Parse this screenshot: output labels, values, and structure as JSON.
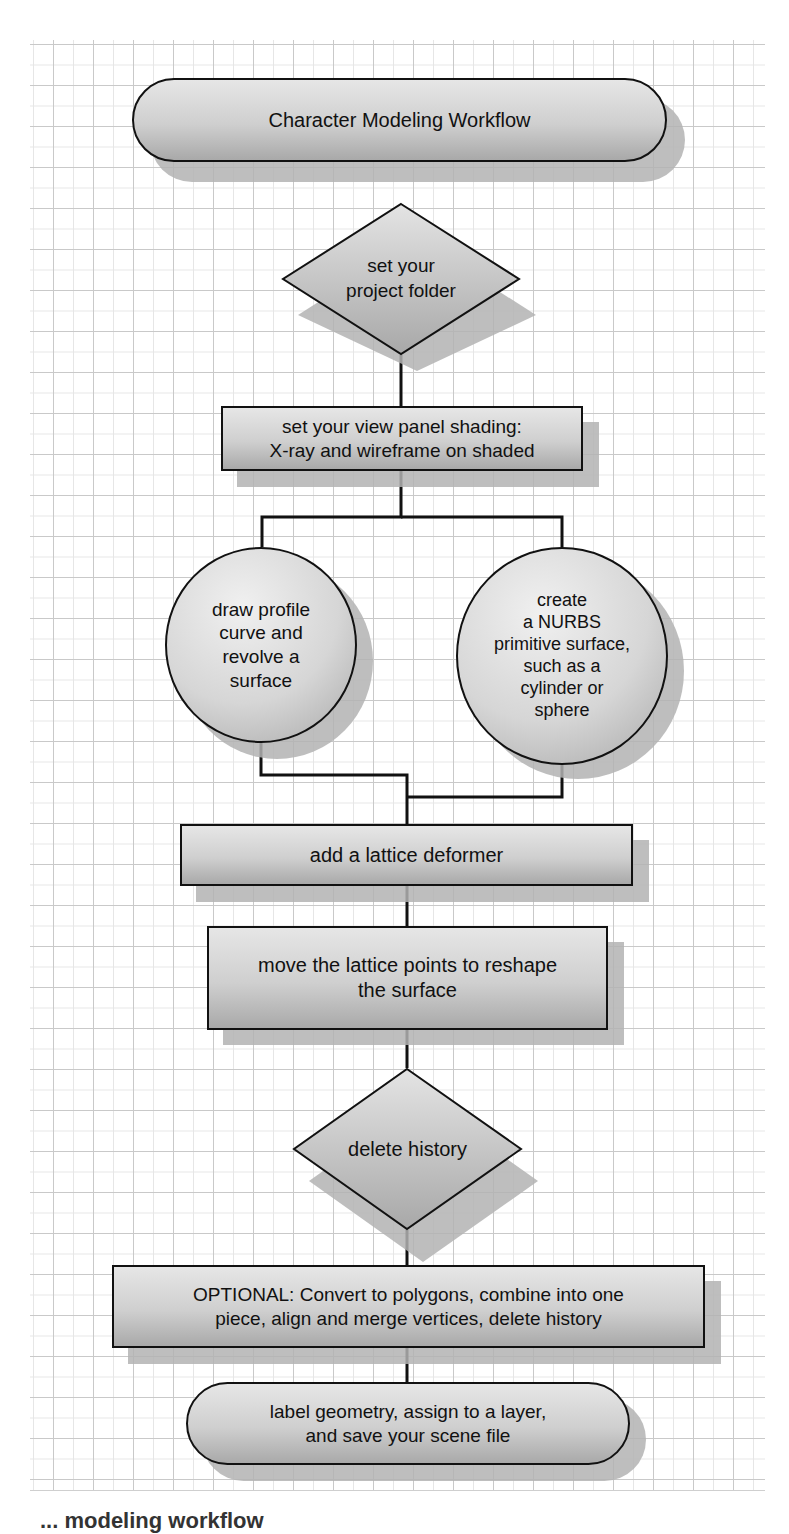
{
  "diagram": {
    "title": "Character Modeling Workflow",
    "nodes": [
      {
        "id": "start",
        "type": "terminator",
        "lines": [
          "Character Modeling Workflow"
        ]
      },
      {
        "id": "project-folder",
        "type": "decision",
        "lines": [
          "set your",
          "project folder"
        ]
      },
      {
        "id": "view-panel",
        "type": "process",
        "lines": [
          "set your view panel shading:",
          "X-ray and wireframe on shaded"
        ]
      },
      {
        "id": "profile-curve",
        "type": "connector-circle",
        "lines": [
          "draw profile",
          "curve and",
          "revolve a",
          "surface"
        ]
      },
      {
        "id": "nurbs-primitive",
        "type": "connector-circle",
        "lines": [
          "create",
          "a NURBS",
          "primitive surface,",
          "such as a",
          "cylinder or",
          "sphere"
        ]
      },
      {
        "id": "lattice",
        "type": "process",
        "lines": [
          "add a lattice deformer"
        ]
      },
      {
        "id": "move-lattice",
        "type": "process",
        "lines": [
          "move the lattice points to reshape",
          "the surface"
        ]
      },
      {
        "id": "delete-history",
        "type": "decision",
        "lines": [
          "delete history"
        ]
      },
      {
        "id": "optional",
        "type": "process",
        "lines": [
          "OPTIONAL: Convert to polygons, combine into one",
          "piece, align and merge vertices, delete history"
        ]
      },
      {
        "id": "end",
        "type": "terminator",
        "lines": [
          "label geometry, assign to a layer,",
          "and save your scene file"
        ]
      }
    ],
    "edges": [
      [
        "start",
        "project-folder"
      ],
      [
        "project-folder",
        "view-panel"
      ],
      [
        "view-panel",
        "profile-curve"
      ],
      [
        "view-panel",
        "nurbs-primitive"
      ],
      [
        "profile-curve",
        "lattice"
      ],
      [
        "nurbs-primitive",
        "lattice"
      ],
      [
        "lattice",
        "move-lattice"
      ],
      [
        "move-lattice",
        "delete-history"
      ],
      [
        "delete-history",
        "optional"
      ],
      [
        "optional",
        "end"
      ]
    ]
  },
  "caption": "... modeling workflow"
}
